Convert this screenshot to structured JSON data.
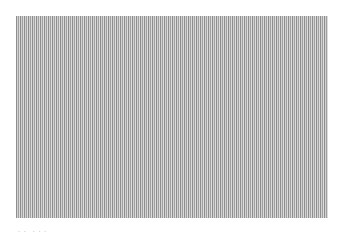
{
  "image": {
    "pattern": "vertical-stripes",
    "colors": {
      "dark_stripe": "#8e8e8e",
      "mid_stripe": "#a0a0a0",
      "light_stripe": "#d2d2d2",
      "lightest_stripe": "#dcdcdc",
      "background": "#ffffff"
    }
  },
  "caption": {
    "group_1": ". .",
    "group_2": ". . ."
  }
}
